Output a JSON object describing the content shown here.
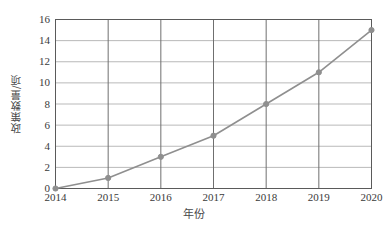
{
  "chart_data": {
    "type": "line",
    "title": "",
    "xlabel": "年份",
    "ylabel": "政策数量/项",
    "categories": [
      "2014",
      "2015",
      "2016",
      "2017",
      "2018",
      "2019",
      "2020"
    ],
    "x": [
      2014,
      2015,
      2016,
      2017,
      2018,
      2019,
      2020
    ],
    "values": [
      0,
      1,
      3,
      5,
      8,
      11,
      15
    ],
    "series": [
      {
        "name": "政策数量",
        "values": [
          0,
          1,
          3,
          5,
          8,
          11,
          15
        ]
      }
    ],
    "ylim": [
      0,
      16
    ],
    "ytick_labels": [
      "0",
      "2",
      "4",
      "6",
      "8",
      "10",
      "12",
      "14",
      "16"
    ],
    "yticks": [
      0,
      2,
      4,
      6,
      8,
      10,
      12,
      14,
      16
    ],
    "xtick_labels": [
      "2014",
      "2015",
      "2016",
      "2017",
      "2018",
      "2019",
      "2020"
    ],
    "grid": "both",
    "legend": "none",
    "marker": "circle",
    "colors": {
      "line": "#8f8f8f",
      "marker": "#8f8f8f",
      "grid_horizontal": "#b9b9b9",
      "grid_vertical": "#6f6f6f",
      "axis": "#5a5a5a",
      "background": "#ffffff",
      "text": "#3a3a3a"
    }
  }
}
